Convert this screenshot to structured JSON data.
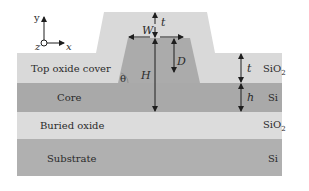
{
  "diagram": {
    "type": "ridge-waveguide-cross-section",
    "axes": {
      "y": "y",
      "x": "x",
      "z": "z"
    },
    "layers": [
      {
        "name": "Top oxide cover",
        "material": "SiO",
        "subscript": "2",
        "color": "#d9d9d9"
      },
      {
        "name": "Core",
        "material": "Si",
        "subscript": "",
        "color": "#a9a9a9"
      },
      {
        "name": "Buried oxide",
        "material": "SiO",
        "subscript": "2",
        "color": "#dcdcdc"
      },
      {
        "name": "Substrate",
        "material": "Si",
        "subscript": "",
        "color": "#b0b0b0"
      }
    ],
    "dimensions": {
      "t_top": "t",
      "W": "W",
      "D": "D",
      "H": "H",
      "theta": "θ",
      "t_side": "t",
      "h": "h"
    }
  }
}
